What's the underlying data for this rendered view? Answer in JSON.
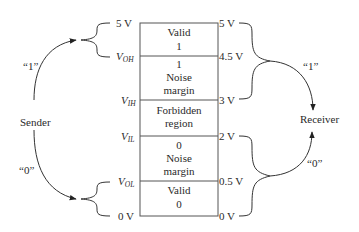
{
  "diagram": {
    "regions": [
      {
        "lines": [
          "Valid",
          "1"
        ]
      },
      {
        "lines": [
          "1",
          "Noise",
          "margin"
        ]
      },
      {
        "lines": [
          "Forbidden",
          "region"
        ]
      },
      {
        "lines": [
          "0",
          "Noise",
          "margin"
        ]
      },
      {
        "lines": [
          "Valid",
          "0"
        ]
      }
    ],
    "left_labels": {
      "top": "5 V",
      "voh": {
        "v": "V",
        "sub": "OH"
      },
      "vih": {
        "v": "V",
        "sub": "IH"
      },
      "vil": {
        "v": "V",
        "sub": "IL"
      },
      "vol": {
        "v": "V",
        "sub": "OL"
      },
      "bottom": "0 V"
    },
    "right_labels": [
      "5 V",
      "4.5 V",
      "3 V",
      "2 V",
      "0.5 V",
      "0 V"
    ],
    "sender": {
      "label": "Sender",
      "one_label": "“1”",
      "zero_label": "“0”"
    },
    "receiver": {
      "label": "Receiver",
      "one_label": "“1”",
      "zero_label": "“0”"
    },
    "colors": {
      "ink": "#2a2a2a",
      "box_line": "#555555"
    }
  }
}
